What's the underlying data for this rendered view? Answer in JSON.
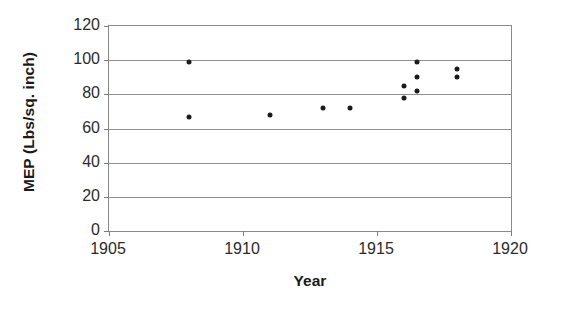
{
  "chart_data": {
    "type": "scatter",
    "title": "",
    "xlabel": "Year",
    "ylabel": "MEP (Lbs/sq. inch)",
    "xlim": [
      1905,
      1920
    ],
    "ylim": [
      0,
      120
    ],
    "xticks": [
      1905,
      1910,
      1915,
      1920
    ],
    "yticks": [
      0,
      20,
      40,
      60,
      80,
      100,
      120
    ],
    "grid": "horizontal",
    "legend": "none",
    "marker": "filled-circle",
    "marker_color": "#1b1b1b",
    "points": [
      {
        "x": 1908.0,
        "y": 99
      },
      {
        "x": 1908.0,
        "y": 67
      },
      {
        "x": 1911.0,
        "y": 68
      },
      {
        "x": 1913.0,
        "y": 72
      },
      {
        "x": 1914.0,
        "y": 72
      },
      {
        "x": 1916.0,
        "y": 85
      },
      {
        "x": 1916.0,
        "y": 78
      },
      {
        "x": 1916.5,
        "y": 99
      },
      {
        "x": 1916.5,
        "y": 90
      },
      {
        "x": 1916.5,
        "y": 82
      },
      {
        "x": 1918.0,
        "y": 95
      },
      {
        "x": 1918.0,
        "y": 90
      }
    ]
  },
  "axes": {
    "y_title": "MEP (Lbs/sq. inch)",
    "x_title": "Year",
    "y_tick_labels": [
      "120",
      "100",
      "80",
      "60",
      "40",
      "20",
      "0"
    ],
    "x_tick_labels": [
      "1905",
      "1910",
      "1915",
      "1920"
    ]
  },
  "colors": {
    "frame": "#8a8a8a",
    "gridline": "#8f8f8f",
    "marker": "#1b1b1b",
    "text": "#2b2b2b",
    "title_text": "#1a1a1a",
    "background": "#ffffff"
  }
}
